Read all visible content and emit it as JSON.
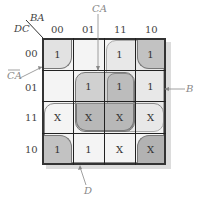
{
  "kmap": {
    "row_var": "DC",
    "col_var": "BA",
    "col_labels": [
      "00",
      "01",
      "11",
      "10"
    ],
    "row_labels": [
      "00",
      "01",
      "11",
      "10"
    ],
    "cells": [
      [
        "1",
        "",
        "1",
        "1"
      ],
      [
        "",
        "1",
        "1",
        "1"
      ],
      [
        "X",
        "X",
        "X",
        "X"
      ],
      [
        "1",
        "1",
        "X",
        "X"
      ]
    ],
    "callouts": {
      "ca": "CA",
      "ca_bar": "CA",
      "b": "B",
      "d": "D"
    },
    "colors": {
      "group_light": "#e6e6e6",
      "group_dark": "#b9b9b9",
      "grid_line": "#222222",
      "background": "#f4f4f4"
    }
  }
}
